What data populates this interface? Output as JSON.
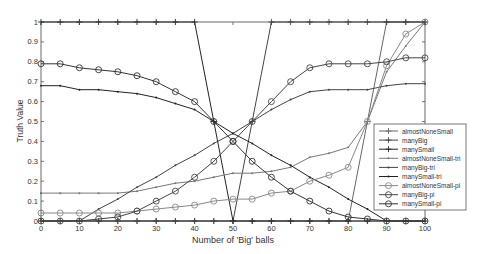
{
  "chart_data": {
    "type": "line",
    "title": "",
    "xlabel": "Number of 'Big' balls",
    "ylabel": "Truth Value",
    "xlim": [
      0,
      100
    ],
    "ylim": [
      0,
      1
    ],
    "grid": false,
    "legend_position": "lower right (inside)",
    "x_ticks": [
      0,
      10,
      20,
      30,
      40,
      50,
      60,
      70,
      80,
      90,
      100
    ],
    "y_ticks": [
      0,
      0.1,
      0.2,
      0.3,
      0.4,
      0.5,
      0.6,
      0.7,
      0.8,
      0.9,
      1
    ],
    "x_tick_labels": [
      "0",
      "10",
      "20",
      "30",
      "40",
      "50",
      "60",
      "70",
      "80",
      "90",
      "100"
    ],
    "y_tick_labels": [
      "0",
      "0.1",
      "0.2",
      "0.3",
      "0.4",
      "0.5",
      "0.6",
      "0.7",
      "0.8",
      "0.9",
      "1"
    ],
    "x": [
      0,
      5,
      10,
      15,
      20,
      25,
      30,
      35,
      40,
      45,
      50,
      55,
      60,
      65,
      70,
      75,
      80,
      85,
      90,
      95,
      100
    ],
    "series": [
      {
        "name": "almostNoneSmall",
        "marker": "plus",
        "color": "#666666",
        "values": [
          0,
          0,
          0,
          0,
          0,
          0,
          0,
          0,
          0,
          0,
          0,
          0,
          0,
          0,
          0,
          0,
          0,
          0.5,
          1,
          1,
          1
        ]
      },
      {
        "name": "manyBig",
        "marker": "plus",
        "color": "#444444",
        "values": [
          0,
          0,
          0,
          0,
          0,
          0,
          0,
          0,
          0,
          0,
          0,
          0.5,
          1,
          1,
          1,
          1,
          1,
          1,
          1,
          1,
          1
        ]
      },
      {
        "name": "manySmall",
        "marker": "plus",
        "color": "#222222",
        "values": [
          1,
          1,
          1,
          1,
          1,
          1,
          1,
          1,
          1,
          0.5,
          0,
          0,
          0,
          0,
          0,
          0,
          0,
          0,
          0,
          0,
          0
        ]
      },
      {
        "name": "almostNoneSmall-tri",
        "marker": "dot",
        "color": "#777777",
        "values": [
          0.14,
          0.14,
          0.14,
          0.14,
          0.14,
          0.15,
          0.17,
          0.19,
          0.2,
          0.22,
          0.24,
          0.24,
          0.25,
          0.27,
          0.32,
          0.34,
          0.37,
          0.5,
          0.75,
          0.88,
          1
        ]
      },
      {
        "name": "manyBig-tri",
        "marker": "dot",
        "color": "#444444",
        "values": [
          0,
          0,
          0,
          0.06,
          0.11,
          0.17,
          0.22,
          0.28,
          0.33,
          0.39,
          0.44,
          0.5,
          0.56,
          0.61,
          0.65,
          0.66,
          0.66,
          0.66,
          0.68,
          0.69,
          0.69
        ]
      },
      {
        "name": "manySmall-tri",
        "marker": "dot",
        "color": "#222222",
        "values": [
          0.68,
          0.68,
          0.66,
          0.66,
          0.65,
          0.64,
          0.62,
          0.59,
          0.56,
          0.5,
          0.44,
          0.39,
          0.33,
          0.28,
          0.22,
          0.17,
          0.11,
          0.06,
          0,
          0,
          0
        ]
      },
      {
        "name": "almostNoneSmall-pi",
        "marker": "circle",
        "color": "#888888",
        "values": [
          0.04,
          0.04,
          0.04,
          0.04,
          0.04,
          0.05,
          0.06,
          0.07,
          0.08,
          0.1,
          0.11,
          0.11,
          0.14,
          0.15,
          0.2,
          0.23,
          0.27,
          0.5,
          0.78,
          0.94,
          1
        ]
      },
      {
        "name": "manyBig-pi",
        "marker": "circle",
        "color": "#444444",
        "values": [
          0,
          0,
          0,
          0.01,
          0.02,
          0.05,
          0.1,
          0.15,
          0.22,
          0.3,
          0.4,
          0.5,
          0.6,
          0.7,
          0.77,
          0.79,
          0.79,
          0.79,
          0.8,
          0.82,
          0.82
        ]
      },
      {
        "name": "manySmall-pi",
        "marker": "circle",
        "color": "#333333",
        "values": [
          0.79,
          0.79,
          0.77,
          0.76,
          0.75,
          0.73,
          0.7,
          0.65,
          0.6,
          0.5,
          0.4,
          0.3,
          0.22,
          0.15,
          0.1,
          0.05,
          0.02,
          0.01,
          0,
          0,
          0
        ]
      }
    ]
  }
}
